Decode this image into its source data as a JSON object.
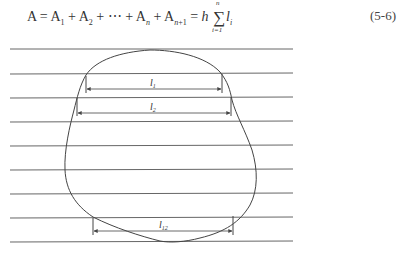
{
  "equation": {
    "lhs": "A",
    "terms": [
      "A1",
      "A2",
      "⋯",
      "An",
      "An+1"
    ],
    "rhs_factor": "h",
    "sum_upper": "n",
    "sum_lower": "i=1",
    "summand": "l",
    "summand_sub": "i",
    "number": "(5-6)"
  },
  "figure": {
    "type": "parallel-line area measurement",
    "parallel_line_count": 9,
    "labels": {
      "l1": {
        "base": "l",
        "sub": "1"
      },
      "l2": {
        "base": "l",
        "sub": "2"
      },
      "l12": {
        "base": "l",
        "sub": "12"
      }
    },
    "line_color": "#555555"
  }
}
